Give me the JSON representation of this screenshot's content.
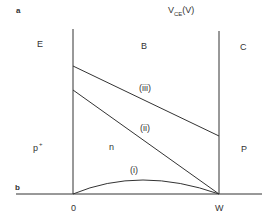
{
  "panels": {
    "a": "a",
    "b": "b"
  },
  "axis": {
    "title_main": "V",
    "title_sub": "CE",
    "title_unit": "(V)",
    "x_start": "0",
    "x_end": "W"
  },
  "regions": {
    "emitter": "E",
    "base": "B",
    "collector": "C"
  },
  "doping": {
    "emitter": "p",
    "emitter_sup": "+",
    "base": "n",
    "collector": "P"
  },
  "curves": [
    {
      "id": "i",
      "label": "(i)",
      "shape": "arc"
    },
    {
      "id": "ii",
      "label": "(ii)",
      "shape": "line"
    },
    {
      "id": "iii",
      "label": "(iii)",
      "shape": "line"
    }
  ],
  "colors": {
    "line": "#333333",
    "text": "#333333",
    "background": "#ffffff"
  }
}
